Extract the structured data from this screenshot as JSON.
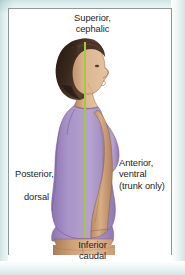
{
  "figure": {
    "name": "anatomical-directional-terms",
    "frame_color": "#8d9699",
    "background_color": "#ffffff",
    "outer_wash_color": "#cfe4e3",
    "midline_color": "#a8c83c",
    "text_color": "#1d1d1d"
  },
  "labels": {
    "superior": "Superior,\ncephalic",
    "inferior": "Inferior\ncaudal",
    "posterior_line1": "Posterior,",
    "posterior_line2": "dorsal",
    "anterior": "Anterior,\nventral\n(trunk only)"
  },
  "palette": {
    "hair_dark": "#2b1d17",
    "hair_mid": "#4a342a",
    "hair_light": "#6f5140",
    "skin_light": "#e3bd9a",
    "skin_mid": "#cfa178",
    "skin_shadow": "#a87c57",
    "leotard_light": "#b9a6d2",
    "leotard_mid": "#9d87bd",
    "leotard_dark": "#7d679d",
    "outline": "#5a3f33"
  }
}
